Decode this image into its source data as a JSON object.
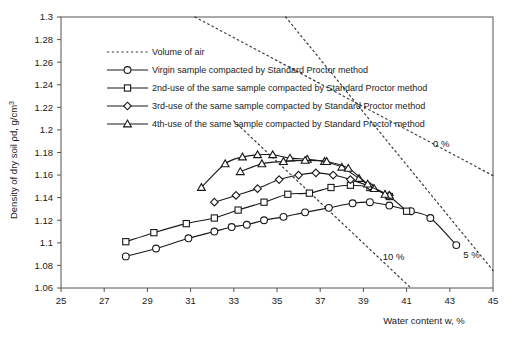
{
  "chart_data": {
    "type": "line",
    "title": "",
    "xlabel": "Water content w, %",
    "ylabel": "Density of dry soil ρd, g/cm³",
    "xlim": [
      25,
      45
    ],
    "ylim": [
      1.06,
      1.3
    ],
    "xticks": [
      25,
      27,
      29,
      31,
      33,
      35,
      37,
      39,
      41,
      43,
      45
    ],
    "yticks": [
      1.06,
      1.08,
      1.1,
      1.12,
      1.14,
      1.16,
      1.18,
      1.2,
      1.22,
      1.24,
      1.26,
      1.28,
      1.3
    ],
    "xtick_labels": [
      "25",
      "27",
      "29",
      "31",
      "33",
      "35",
      "37",
      "39",
      "41",
      "43",
      "45"
    ],
    "ytick_labels": [
      "1.06",
      "1.08",
      "1.1",
      "1.12",
      "1.14",
      "1.16",
      "1.18",
      "1.2",
      "1.22",
      "1.24",
      "1.26",
      "1.28",
      "1.3"
    ],
    "grid": false,
    "legend_position": "top-left-inside",
    "series": [
      {
        "name": "Volume of air",
        "marker": "none",
        "style": "dotted",
        "values": []
      },
      {
        "name": "Virgin sample compacted by Standard Proctor method",
        "marker": "circle",
        "style": "solid",
        "x": [
          28.0,
          29.4,
          30.9,
          32.1,
          32.9,
          33.6,
          34.4,
          35.3,
          36.3,
          37.4,
          38.5,
          39.3,
          40.2,
          41.2,
          42.1,
          43.3
        ],
        "y": [
          1.088,
          1.095,
          1.104,
          1.11,
          1.114,
          1.116,
          1.12,
          1.123,
          1.127,
          1.131,
          1.135,
          1.136,
          1.133,
          1.128,
          1.122,
          1.098
        ]
      },
      {
        "name": "2nd-use of the same sample compacted by Standard Proctor method",
        "marker": "square",
        "style": "solid",
        "x": [
          28.0,
          29.3,
          30.8,
          32.1,
          33.2,
          34.4,
          35.5,
          36.5,
          37.5,
          38.4,
          39.3,
          40.2,
          41.0
        ],
        "y": [
          1.101,
          1.109,
          1.117,
          1.122,
          1.129,
          1.136,
          1.143,
          1.144,
          1.149,
          1.151,
          1.149,
          1.141,
          1.128
        ]
      },
      {
        "name": "3rd-use of the same sample compacted by Standard Proctor method",
        "marker": "diamond",
        "style": "solid",
        "x": [
          32.1,
          33.1,
          34.1,
          35.1,
          36.0,
          36.8,
          37.6,
          38.4,
          39.3,
          40.2
        ],
        "y": [
          1.136,
          1.142,
          1.148,
          1.156,
          1.16,
          1.162,
          1.16,
          1.156,
          1.15,
          1.142
        ]
      },
      {
        "name": "4th-use of the same sample compacted by Standard Proctor method",
        "marker": "triangle",
        "style": "solid",
        "x": [
          31.5,
          32.6,
          33.4,
          34.1,
          34.8,
          35.6,
          36.4,
          37.2,
          38.0,
          38.8,
          39.5,
          40.2
        ],
        "y": [
          1.149,
          1.17,
          1.176,
          1.178,
          1.178,
          1.175,
          1.174,
          1.172,
          1.167,
          1.157,
          1.148,
          1.142
        ]
      },
      {
        "name": "4th-use secondary branch",
        "marker": "triangle",
        "style": "solid",
        "x": [
          33.3,
          34.3,
          35.3,
          36.3,
          37.3,
          38.3,
          39.2,
          40.0
        ],
        "y": [
          1.163,
          1.17,
          1.172,
          1.173,
          1.172,
          1.166,
          1.152,
          1.143
        ]
      }
    ],
    "annotations": [
      {
        "text": "0 %",
        "x": 42.6,
        "y": 1.1845
      },
      {
        "text": "5 %",
        "x": 44.0,
        "y": 1.0865
      },
      {
        "text": "10 %",
        "x": 40.4,
        "y": 1.0845
      }
    ],
    "air_void_lines": [
      {
        "label": "0 %",
        "x": [
          31.2,
          45.0
        ],
        "y": [
          1.3,
          1.1595
        ]
      },
      {
        "label": "5 %",
        "x": [
          35.4,
          45.0
        ],
        "y": [
          1.3,
          1.0755
        ]
      },
      {
        "label": "10 %",
        "x": [
          33.0,
          41.2
        ],
        "y": [
          1.208,
          1.06
        ]
      }
    ],
    "legend_entries": [
      "Volume of air",
      "Virgin sample compacted by Standard Proctor method",
      "2nd-use of the same sample compacted by Standard Proctor method",
      "3rd-use of the same sample compacted by Standard Proctor method",
      "4th-use of the same sample compacted by Standard Proctor method"
    ],
    "colors": {
      "line": "#1a1a1a",
      "axis": "#555555",
      "air": "#3a3a3a",
      "background": "#ffffff"
    }
  }
}
